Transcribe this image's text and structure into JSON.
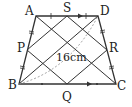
{
  "diagram": {
    "type": "trapezoid",
    "points": {
      "A": {
        "label": "A",
        "x": 36,
        "y": 16
      },
      "D": {
        "label": "D",
        "x": 98,
        "y": 16
      },
      "B": {
        "label": "B",
        "x": 19,
        "y": 84
      },
      "C": {
        "label": "C",
        "x": 116,
        "y": 84
      },
      "S": {
        "label": "S",
        "x": 67,
        "y": 16
      },
      "Q": {
        "label": "Q",
        "x": 67,
        "y": 84
      },
      "P": {
        "label": "P",
        "x": 27,
        "y": 50
      },
      "R": {
        "label": "R",
        "x": 107,
        "y": 50
      }
    },
    "labels": {
      "A": "A",
      "S": "S",
      "D": "D",
      "P": "P",
      "R": "R",
      "B": "B",
      "Q": "Q",
      "C": "C"
    },
    "measurement": "16cm",
    "colors": {
      "stroke": "#333333",
      "dashed": "#888888",
      "text": "#222222",
      "background": "#ffffff"
    }
  }
}
